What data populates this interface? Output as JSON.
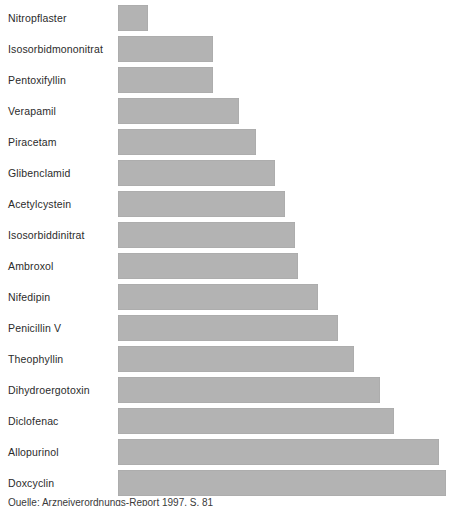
{
  "chart_data": {
    "type": "bar",
    "orientation": "horizontal",
    "title": "",
    "subtitle": "",
    "xlabel": "",
    "ylabel": "",
    "grid": false,
    "legend": null,
    "axis_visible": false,
    "tick_labels_visible": false,
    "bar_color": "#b3b3b3",
    "label_color": "#2b2b2b",
    "background": "#ffffff",
    "xlim": [
      0,
      100
    ],
    "sorted": "ascending-top-to-bottom",
    "value_unit": "relative bar length (%)",
    "categories": [
      "Nitropflaster",
      "Isosorbidmononitrat",
      "Pentoxifyllin",
      "Verapamil",
      "Piracetam",
      "Glibenclamid",
      "Acetylcystein",
      "Isosorbiddinitrat",
      "Ambroxol",
      "Nifedipin",
      "Penicillin V",
      "Theophyllin",
      "Dihydroergotoxin",
      "Diclofenac",
      "Allopurinol",
      "Doxcyclin"
    ],
    "values": [
      9,
      29,
      29,
      37,
      42,
      48,
      51,
      54,
      55,
      61,
      67,
      72,
      80,
      84,
      98,
      100
    ]
  },
  "caption": {
    "text_clipped": "Quelle: Arzneiverordnungs-Report 1997, S. 81",
    "visible": "partially clipped at bottom edge"
  }
}
